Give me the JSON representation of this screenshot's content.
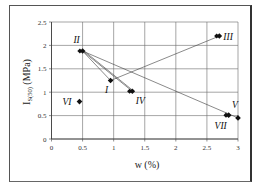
{
  "chart_data": {
    "type": "scatter",
    "title": "",
    "xlabel": "w (%)",
    "ylabel": "Is(50) (MPa)",
    "ylabel_main": "I",
    "ylabel_sub": "S(50)",
    "ylabel_unit": " (MPa)",
    "xlim": [
      0,
      3
    ],
    "ylim": [
      0,
      2.5
    ],
    "xticks": [
      "0",
      "0.5",
      "1",
      "1.5",
      "2",
      "2.5",
      "3"
    ],
    "yticks": [
      "0",
      "0.5",
      "1",
      "1.5",
      "2",
      "2.5"
    ],
    "grid": true,
    "legend": "none",
    "points": [
      {
        "label": "I",
        "x": 0.95,
        "y": 1.25
      },
      {
        "label": "II",
        "x": 0.5,
        "y": 1.88
      },
      {
        "label": "III",
        "x": 2.7,
        "y": 2.2
      },
      {
        "label": "IV",
        "x": 1.3,
        "y": 1.02
      },
      {
        "label": "V",
        "x": 3.0,
        "y": 0.45
      },
      {
        "label": "VI",
        "x": 0.45,
        "y": 0.8
      },
      {
        "label": "VII",
        "x": 2.85,
        "y": 0.51
      }
    ],
    "segments": [
      {
        "from": "II",
        "to": "I"
      },
      {
        "from": "II",
        "to": "IV"
      },
      {
        "from": "II",
        "to": "V"
      },
      {
        "from": "I",
        "to": "III"
      }
    ]
  }
}
